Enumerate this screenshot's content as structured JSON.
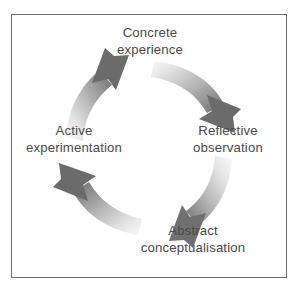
{
  "figure": {
    "name": "experiential-learning-cycle",
    "background_color": "#ffffff",
    "frame_border_color": "#6f6f6f",
    "text_color": "#4a4a4a"
  },
  "diagram": {
    "type": "cycle",
    "direction": "clockwise",
    "stage_count": 4,
    "stages": [
      {
        "id": "concrete-experience",
        "position": "top",
        "line1": "Concrete",
        "line2": "experience"
      },
      {
        "id": "reflective-observation",
        "position": "right",
        "line1": "Reflective",
        "line2": "observation"
      },
      {
        "id": "abstract-conceptualisation",
        "position": "bottom",
        "line1": "Abstract",
        "line2": "conceptualisation"
      },
      {
        "id": "active-experimentation",
        "position": "left",
        "line1": "Active",
        "line2": "experimentation"
      }
    ],
    "arrows": [
      {
        "id": "arrow-concrete-to-reflective",
        "from": "concrete-experience",
        "to": "reflective-observation",
        "quadrant": "top-right",
        "gradient_start_color": "#f2f2f2",
        "gradient_end_color": "#6b6b6b"
      },
      {
        "id": "arrow-reflective-to-abstract",
        "from": "reflective-observation",
        "to": "abstract-conceptualisation",
        "quadrant": "bottom-right",
        "gradient_start_color": "#f2f2f2",
        "gradient_end_color": "#707070"
      },
      {
        "id": "arrow-abstract-to-active",
        "from": "abstract-conceptualisation",
        "to": "active-experimentation",
        "quadrant": "bottom-left",
        "gradient_start_color": "#f2f2f2",
        "gradient_end_color": "#6b6b6b"
      },
      {
        "id": "arrow-active-to-concrete",
        "from": "active-experimentation",
        "to": "concrete-experience",
        "quadrant": "top-left",
        "gradient_start_color": "#f2f2f2",
        "gradient_end_color": "#6b6b6b"
      }
    ]
  }
}
